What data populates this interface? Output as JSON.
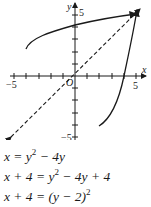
{
  "graph": {
    "axes": {
      "x_label": "x",
      "y_label": "y",
      "origin_label": "O",
      "x_min_label": "−5",
      "x_max_label": "5",
      "y_max_label": "5",
      "y_min_label": "−5"
    },
    "curves": [
      {
        "name": "x = y^2 - 4y (upper branch)",
        "style": "solid"
      },
      {
        "name": "y = x^2 - 4x (inverse)",
        "style": "solid"
      },
      {
        "name": "y = x",
        "style": "dashed"
      }
    ],
    "colors": {
      "ink": "#1a1a1a",
      "background": "#ffffff"
    }
  },
  "equations": {
    "line1": {
      "lhs": "x = y",
      "exp": "2",
      "rhs": " − 4y"
    },
    "line2": {
      "lhs": "x + 4 = y",
      "exp": "2",
      "rhs": " − 4y + 4"
    },
    "line3": {
      "lhs": "x + 4 = (y − 2)",
      "exp": "2",
      "rhs": ""
    }
  }
}
